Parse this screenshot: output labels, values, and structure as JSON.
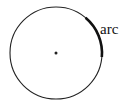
{
  "diagram": {
    "type": "circle-arc",
    "circle": {
      "cx": 56,
      "cy": 53,
      "r": 46,
      "stroke": "#222222"
    },
    "center_point": {
      "cx": 56,
      "cy": 53
    },
    "arc": {
      "start_deg": -50,
      "end_deg": 5,
      "stroke": "#111111"
    },
    "label": {
      "text": "arc",
      "x": 100,
      "y": 34
    }
  }
}
